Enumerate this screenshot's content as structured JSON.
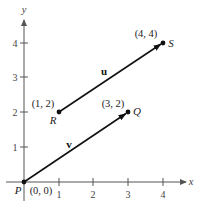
{
  "diagram": {
    "axes": {
      "x_label": "x",
      "y_label": "y",
      "x_ticks": [
        "1",
        "2",
        "3",
        "4"
      ],
      "y_ticks": [
        "1",
        "2",
        "3",
        "4"
      ]
    },
    "points": {
      "P": {
        "name": "P",
        "coords": "(0, 0)"
      },
      "Q": {
        "name": "Q",
        "coords": "(3, 2)"
      },
      "R": {
        "name": "R",
        "coords": "(1, 2)"
      },
      "S": {
        "name": "S",
        "coords": "(4, 4)"
      }
    },
    "vectors": {
      "u": {
        "name": "u",
        "from": "R",
        "to": "S"
      },
      "v": {
        "name": "v",
        "from": "P",
        "to": "Q"
      }
    },
    "colors": {
      "axis": "#555555",
      "vector": "#111111",
      "background": "#ffffff"
    }
  }
}
